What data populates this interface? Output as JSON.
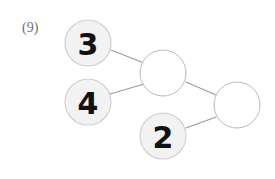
{
  "worksheet": {
    "problem_label": "(9)",
    "type": "number-bond-chain"
  },
  "theme": {
    "page_background": "#ffffff",
    "filled_node_fill": "#f2f2f2",
    "filled_node_stroke": "#cfcfcf",
    "empty_node_fill": "#ffffff",
    "empty_node_stroke": "#b9b9b9",
    "connector_color": "#9a9a9a",
    "numeral_color": "#111111",
    "label_color": "#6e6e6e"
  },
  "diagram": {
    "nodes": [
      {
        "id": "n1",
        "value": "3",
        "state": "filled",
        "cx": 88,
        "cy": 43,
        "r": 23
      },
      {
        "id": "n2",
        "value": "4",
        "state": "filled",
        "cx": 88,
        "cy": 102,
        "r": 23
      },
      {
        "id": "n3",
        "value": "",
        "state": "empty",
        "cx": 163,
        "cy": 73,
        "r": 23
      },
      {
        "id": "n4",
        "value": "2",
        "state": "filled",
        "cx": 163,
        "cy": 136,
        "r": 23
      },
      {
        "id": "n5",
        "value": "",
        "state": "empty",
        "cx": 237,
        "cy": 105,
        "r": 23
      }
    ],
    "edges": [
      {
        "id": "e1",
        "from": "n1",
        "to": "n3",
        "x1": 111,
        "y1": 50,
        "x2": 144,
        "y2": 63
      },
      {
        "id": "e2",
        "from": "n2",
        "to": "n3",
        "x1": 110,
        "y1": 94,
        "x2": 144,
        "y2": 84
      },
      {
        "id": "e3",
        "from": "n3",
        "to": "n5",
        "x1": 186,
        "y1": 82,
        "x2": 216,
        "y2": 95
      },
      {
        "id": "e4",
        "from": "n4",
        "to": "n5",
        "x1": 186,
        "y1": 128,
        "x2": 216,
        "y2": 117
      }
    ]
  }
}
